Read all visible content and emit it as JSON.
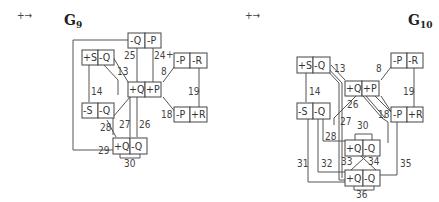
{
  "diagrams": [
    {
      "id": "g9",
      "title_main": "G",
      "title_sub": "9",
      "symbol": "+→",
      "nodes": [
        {
          "id": "top",
          "cells": [
            "-Q",
            "-P"
          ]
        },
        {
          "id": "sq",
          "cells": [
            "+S",
            "-Q"
          ]
        },
        {
          "id": "center",
          "cells": [
            "+Q",
            "+P"
          ]
        },
        {
          "id": "pr",
          "cells": [
            "-P",
            "-R"
          ]
        },
        {
          "id": "msq",
          "cells": [
            "-S",
            "-Q"
          ]
        },
        {
          "id": "pr2",
          "cells": [
            "-P",
            "+R"
          ]
        },
        {
          "id": "bottom",
          "cells": [
            "+Q",
            "-Q"
          ]
        }
      ],
      "edge_labels": [
        "25",
        "24",
        "13",
        "8",
        "14",
        "19",
        "18",
        "28",
        "27",
        "26",
        "29",
        "30"
      ],
      "marker_24": "+"
    },
    {
      "id": "g10",
      "title_main": "G",
      "title_sub": "10",
      "symbol": "+→",
      "nodes": [
        {
          "id": "sq",
          "cells": [
            "+S",
            "-Q"
          ]
        },
        {
          "id": "center",
          "cells": [
            "+Q",
            "+P"
          ]
        },
        {
          "id": "pr",
          "cells": [
            "-P",
            "-R"
          ]
        },
        {
          "id": "msq",
          "cells": [
            "-S",
            "-Q"
          ]
        },
        {
          "id": "pr2",
          "cells": [
            "-P",
            "+R"
          ]
        },
        {
          "id": "mid",
          "cells": [
            "+Q",
            "-Q"
          ]
        },
        {
          "id": "bottom",
          "cells": [
            "+Q",
            "-Q"
          ]
        }
      ],
      "edge_labels": [
        "13",
        "8",
        "14",
        "19",
        "26",
        "18",
        "27",
        "30",
        "28",
        "31",
        "32",
        "33",
        "34",
        "35",
        "36"
      ]
    }
  ]
}
